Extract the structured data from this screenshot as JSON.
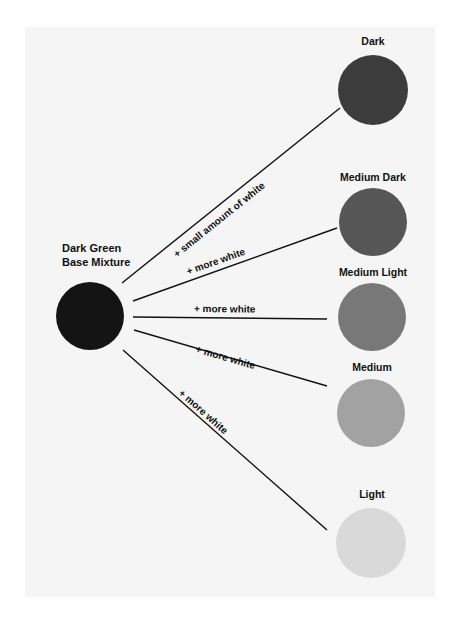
{
  "base": {
    "label_line1": "Dark Green",
    "label_line2": "Base Mixture",
    "color": "#141414"
  },
  "swatches": [
    {
      "label": "Dark",
      "color": "#3c3c3c"
    },
    {
      "label": "Medium Dark",
      "color": "#565656"
    },
    {
      "label": "Medium Light",
      "color": "#787878"
    },
    {
      "label": "Medium",
      "color": "#a2a2a2"
    },
    {
      "label": "Light",
      "color": "#d9d9d9"
    }
  ],
  "edges": [
    {
      "label": "+ small amount of white"
    },
    {
      "label": "+ more white"
    },
    {
      "label": "+ more white"
    },
    {
      "label": "+ more white"
    },
    {
      "label": "+ more white"
    }
  ]
}
